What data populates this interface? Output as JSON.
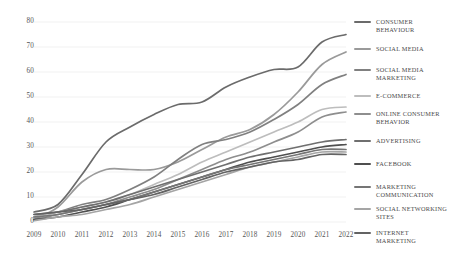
{
  "chart_data": {
    "type": "line",
    "title": "",
    "subtitle": "",
    "xlabel": "",
    "ylabel": "",
    "x": [
      2009,
      2010,
      2011,
      2012,
      2013,
      2014,
      2015,
      2016,
      2017,
      2018,
      2019,
      2020,
      2021,
      2022
    ],
    "xtick_labels": [
      "2009",
      "2010",
      "2011",
      "2012",
      "2013",
      "2014",
      "2015",
      "2016",
      "2017",
      "2018",
      "2019",
      "2020",
      "2021",
      "2022"
    ],
    "ytick_labels": [
      "0",
      "10",
      "20",
      "30",
      "40",
      "50",
      "60",
      "70",
      "80"
    ],
    "yticks": [
      0,
      10,
      20,
      30,
      40,
      50,
      60,
      70,
      80
    ],
    "ylim": [
      0,
      80
    ],
    "xlim": [
      2009,
      2022
    ],
    "grid": true,
    "grid_axis": "y",
    "legend_position": "right",
    "series": [
      {
        "name": "CONSUMER BEHAVIOUR",
        "color": "#6b6b6b",
        "values": [
          4,
          7,
          19,
          32,
          38,
          43,
          47,
          48,
          54,
          58,
          61,
          62,
          72,
          75
        ]
      },
      {
        "name": "SOCIAL MEDIA",
        "color": "#9a9a9a",
        "values": [
          1,
          6,
          16,
          21,
          21,
          21,
          24,
          29,
          34,
          37,
          43,
          52,
          63,
          68
        ]
      },
      {
        "name": "SOCIAL MEDIA MARKETING",
        "color": "#808080",
        "values": [
          2,
          4,
          7,
          9,
          13,
          18,
          25,
          31,
          33,
          36,
          41,
          47,
          55,
          59
        ]
      },
      {
        "name": "E-COMMERCE",
        "color": "#bdbdbd",
        "values": [
          2,
          4,
          6,
          8,
          11,
          15,
          19,
          24,
          28,
          32,
          36,
          40,
          45,
          46
        ]
      },
      {
        "name": "ONLINE CONSUMER BEHAVIOR",
        "color": "#8e8e8e",
        "values": [
          1,
          3,
          5,
          7,
          10,
          13,
          17,
          21,
          25,
          28,
          32,
          36,
          42,
          44
        ]
      },
      {
        "name": "ADVERTISING",
        "color": "#6f6f6f",
        "values": [
          3,
          4,
          6,
          8,
          11,
          14,
          17,
          20,
          23,
          26,
          28,
          30,
          32,
          33
        ]
      },
      {
        "name": "FACEBOOK",
        "color": "#4f4f4f",
        "values": [
          1,
          2,
          4,
          6,
          9,
          12,
          15,
          18,
          21,
          24,
          26,
          28,
          30,
          31
        ]
      },
      {
        "name": "MARKETING COMMUNICATION",
        "color": "#757575",
        "values": [
          2,
          3,
          5,
          7,
          9,
          12,
          15,
          18,
          21,
          23,
          25,
          27,
          29,
          29
        ]
      },
      {
        "name": "SOCIAL NETWORKING SITES",
        "color": "#a5a5a5",
        "values": [
          0.5,
          2,
          3,
          5,
          7,
          10,
          13,
          16,
          19,
          22,
          24,
          26,
          28,
          28
        ]
      },
      {
        "name": "INTERNET MARKETING",
        "color": "#636363",
        "values": [
          3,
          4,
          5,
          7,
          9,
          11,
          14,
          17,
          20,
          22,
          24,
          25,
          27,
          27
        ]
      }
    ]
  },
  "axis": {
    "y_label_color": "#555555",
    "x_label_color": "#555555",
    "grid_color": "#ededed"
  }
}
